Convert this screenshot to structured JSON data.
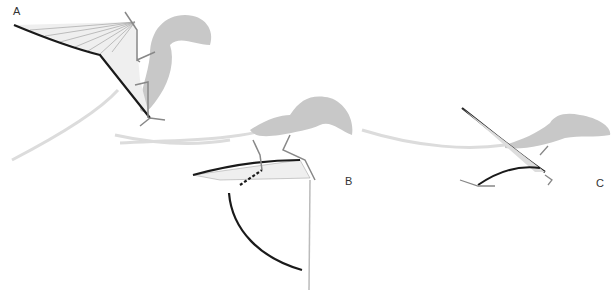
{
  "figure": {
    "panels": [
      {
        "id": "A",
        "label": "A",
        "pose": "crouched, wings raised"
      },
      {
        "id": "B",
        "label": "B",
        "pose": "wings folded, forelimb vaulting"
      },
      {
        "id": "C",
        "label": "C",
        "pose": "quadrupedal, wing raised diagonally"
      }
    ],
    "colors": {
      "body_silhouette": "#c8c8c8",
      "wing_membrane": "#eeeeee",
      "leading_edge": "#1a1a1a",
      "trajectory": "#d6d6d6",
      "bones": "#888888"
    }
  }
}
